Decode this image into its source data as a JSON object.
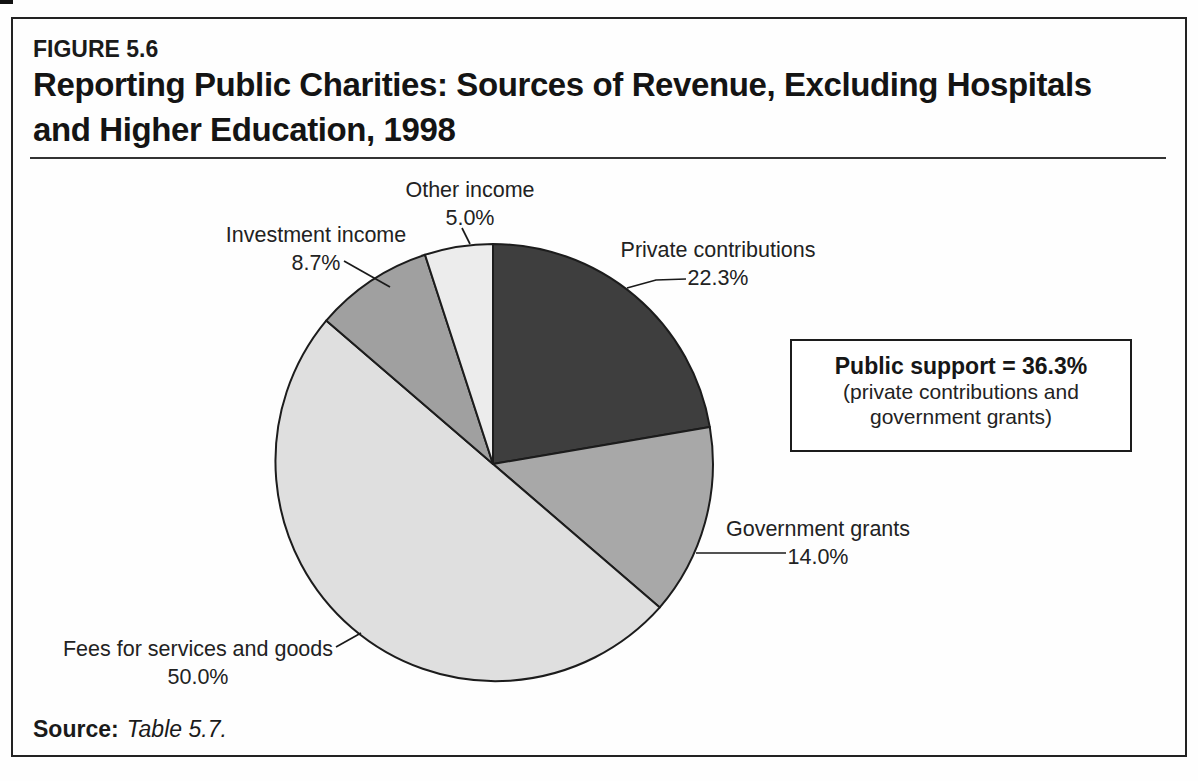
{
  "figure": {
    "label": "FIGURE 5.6",
    "title_line1": "Reporting Public Charities: Sources of Revenue, Excluding Hospitals",
    "title_line2": "and Higher Education, 1998"
  },
  "summary_box": {
    "title": "Public support = 36.3%",
    "note_line1": "(private contributions and",
    "note_line2": "government grants)"
  },
  "source": {
    "label": "Source:",
    "value": "Table 5.7."
  },
  "chart_data": {
    "type": "pie",
    "title": "Reporting Public Charities: Sources of Revenue, Excluding Hospitals and Higher Education, 1998",
    "unit": "percent",
    "total": 100.0,
    "start_position": "12-o-clock",
    "direction": "clockwise",
    "slices": [
      {
        "label": "Private contributions",
        "value": 22.3,
        "color": "#3e3e3e"
      },
      {
        "label": "Government grants",
        "value": 14.0,
        "color": "#a8a8a8"
      },
      {
        "label": "Fees for services and goods",
        "value": 50.0,
        "color": "#dfdfdf"
      },
      {
        "label": "Investment income",
        "value": 8.7,
        "color": "#a0a0a0"
      },
      {
        "label": "Other income",
        "value": 5.0,
        "color": "#ececec"
      }
    ],
    "annotation": "Public support = 36.3% (private contributions and government grants)"
  }
}
